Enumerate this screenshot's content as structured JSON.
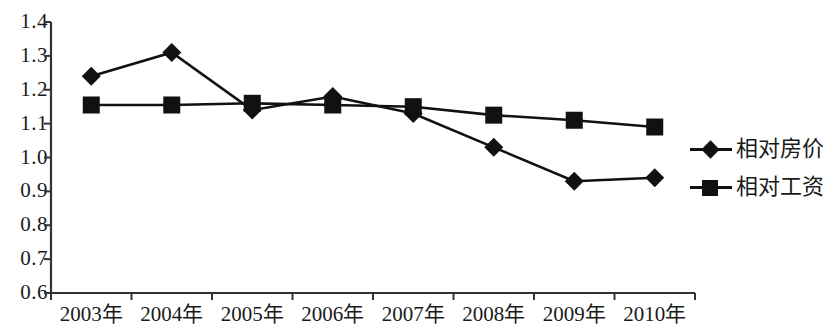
{
  "chart_data": {
    "type": "line",
    "title": "",
    "xlabel": "",
    "ylabel": "",
    "categories": [
      "2003年",
      "2004年",
      "2005年",
      "2006年",
      "2007年",
      "2008年",
      "2009年",
      "2010年"
    ],
    "ylim": [
      0.6,
      1.4
    ],
    "ytick_labels": [
      "1.4",
      "1.3",
      "1.2",
      "1.1",
      "1.0",
      "0.9",
      "0.8",
      "0.7",
      "0.6"
    ],
    "ytick_values": [
      1.4,
      1.3,
      1.2,
      1.1,
      1.0,
      0.9,
      0.8,
      0.7,
      0.6
    ],
    "grid": false,
    "legend_position": "right",
    "series": [
      {
        "name": "相对房价",
        "marker": "diamond",
        "color": "#111111",
        "values": [
          1.24,
          1.31,
          1.14,
          1.18,
          1.13,
          1.03,
          0.93,
          0.94
        ]
      },
      {
        "name": "相对工资",
        "marker": "square",
        "color": "#111111",
        "values": [
          1.155,
          1.155,
          1.16,
          1.155,
          1.15,
          1.125,
          1.11,
          1.09
        ]
      }
    ]
  },
  "legend": {
    "items": [
      {
        "label": "相对房价",
        "marker": "diamond-marker"
      },
      {
        "label": "相对工资",
        "marker": "square-marker"
      }
    ]
  },
  "axes": {
    "axis_color": "#333333"
  }
}
